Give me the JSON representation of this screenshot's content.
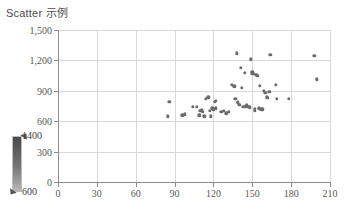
{
  "chart_data": {
    "type": "scatter",
    "title": "Scatter 示例",
    "xlabel": "",
    "ylabel": "",
    "xlim": [
      0,
      210
    ],
    "ylim": [
      0,
      1500
    ],
    "xticks": [
      0,
      30,
      60,
      90,
      120,
      150,
      180,
      210
    ],
    "yticks": [
      0,
      300,
      600,
      900,
      1200,
      1500
    ],
    "xtick_labels": [
      "0",
      "30",
      "60",
      "90",
      "120",
      "150",
      "180",
      "210"
    ],
    "ytick_labels": [
      "0",
      "300",
      "600",
      "900",
      "1,200",
      "1,500"
    ],
    "grid": true,
    "legend_position": "left-outside",
    "marker_color": "#6b6b6b",
    "marker_size": 3.4,
    "colorbar": {
      "label_max": "1400",
      "label_min": "600",
      "vmin": 600,
      "vmax": 1400,
      "gradient_top": "#4a4a4a",
      "gradient_bottom": "#b8b8b8",
      "orientation": "vertical"
    },
    "points": [
      {
        "x": 85,
        "y": 648
      },
      {
        "x": 86,
        "y": 790
      },
      {
        "x": 96,
        "y": 660
      },
      {
        "x": 98,
        "y": 668
      },
      {
        "x": 104,
        "y": 742
      },
      {
        "x": 107,
        "y": 742
      },
      {
        "x": 109,
        "y": 660
      },
      {
        "x": 110,
        "y": 700
      },
      {
        "x": 111,
        "y": 706
      },
      {
        "x": 112,
        "y": 694
      },
      {
        "x": 113,
        "y": 648
      },
      {
        "x": 114,
        "y": 822
      },
      {
        "x": 116,
        "y": 836
      },
      {
        "x": 117,
        "y": 704
      },
      {
        "x": 118,
        "y": 648
      },
      {
        "x": 119,
        "y": 728
      },
      {
        "x": 120,
        "y": 718
      },
      {
        "x": 121,
        "y": 790
      },
      {
        "x": 122,
        "y": 800
      },
      {
        "x": 122,
        "y": 726
      },
      {
        "x": 126,
        "y": 690
      },
      {
        "x": 128,
        "y": 700
      },
      {
        "x": 130,
        "y": 676
      },
      {
        "x": 132,
        "y": 690
      },
      {
        "x": 134,
        "y": 960
      },
      {
        "x": 136,
        "y": 946
      },
      {
        "x": 137,
        "y": 820
      },
      {
        "x": 138,
        "y": 1270
      },
      {
        "x": 139,
        "y": 786
      },
      {
        "x": 140,
        "y": 760
      },
      {
        "x": 141,
        "y": 1128
      },
      {
        "x": 142,
        "y": 930
      },
      {
        "x": 143,
        "y": 742
      },
      {
        "x": 144,
        "y": 1078
      },
      {
        "x": 145,
        "y": 748
      },
      {
        "x": 146,
        "y": 758
      },
      {
        "x": 147,
        "y": 740
      },
      {
        "x": 148,
        "y": 738
      },
      {
        "x": 149,
        "y": 1210
      },
      {
        "x": 150,
        "y": 1088
      },
      {
        "x": 150,
        "y": 1074
      },
      {
        "x": 151,
        "y": 1066
      },
      {
        "x": 152,
        "y": 720
      },
      {
        "x": 152,
        "y": 700
      },
      {
        "x": 153,
        "y": 1058
      },
      {
        "x": 154,
        "y": 1050
      },
      {
        "x": 155,
        "y": 726
      },
      {
        "x": 156,
        "y": 952
      },
      {
        "x": 157,
        "y": 718
      },
      {
        "x": 158,
        "y": 716
      },
      {
        "x": 159,
        "y": 900
      },
      {
        "x": 160,
        "y": 880
      },
      {
        "x": 161,
        "y": 836
      },
      {
        "x": 162,
        "y": 828
      },
      {
        "x": 163,
        "y": 890
      },
      {
        "x": 164,
        "y": 1256
      },
      {
        "x": 168,
        "y": 962
      },
      {
        "x": 169,
        "y": 820
      },
      {
        "x": 178,
        "y": 818
      },
      {
        "x": 198,
        "y": 1248
      },
      {
        "x": 200,
        "y": 1012
      }
    ]
  }
}
